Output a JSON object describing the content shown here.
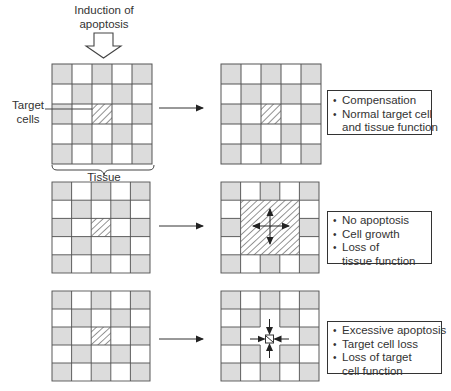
{
  "diagram": {
    "induction_label_line1": "Induction of",
    "induction_label_line2": "apoptosis",
    "target_label_line1": "Target",
    "target_label_line2": "cells",
    "tissue_label": "Tissue",
    "colors": {
      "gray_cell": "#dcdcdc",
      "white_cell": "#ffffff",
      "grid_line": "#555555",
      "hatch": "#333333",
      "arrow": "#333333"
    },
    "rows": [
      {
        "name": "compensation",
        "outcome_box": {
          "items": [
            {
              "line1": "Compensation",
              "line2": ""
            },
            {
              "line1": "Normal target cell",
              "line2": "and tissue function"
            }
          ]
        }
      },
      {
        "name": "no-apoptosis",
        "outcome_box": {
          "items": [
            {
              "line1": "No apoptosis",
              "line2": ""
            },
            {
              "line1": "Cell growth",
              "line2": ""
            },
            {
              "line1": "Loss of",
              "line2": "tissue function"
            }
          ]
        }
      },
      {
        "name": "excessive-apoptosis",
        "outcome_box": {
          "items": [
            {
              "line1": "Excessive apoptosis",
              "line2": ""
            },
            {
              "line1": "Target cell loss",
              "line2": ""
            },
            {
              "line1": "Loss of target",
              "line2": "cell function"
            }
          ]
        }
      }
    ]
  }
}
